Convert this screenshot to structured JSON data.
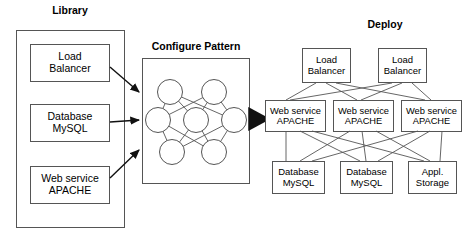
{
  "diagram": {
    "title_library": "Library",
    "title_configure": "Configure Pattern",
    "title_deploy": "Deploy",
    "library_items": [
      {
        "label": "Load\nBalancer"
      },
      {
        "label": "Database\nMySQL"
      },
      {
        "label": "Web service\nAPACHE"
      }
    ],
    "deploy_tier_load_balancers": [
      {
        "label": "Load\nBalancer"
      },
      {
        "label": "Load\nBalancer"
      }
    ],
    "deploy_tier_web_services": [
      {
        "label": "Web service\nAPACHE"
      },
      {
        "label": "Web service\nAPACHE"
      },
      {
        "label": "Web service\nAPACHE"
      }
    ],
    "deploy_tier_storage": [
      {
        "label": "Database\nMySQL"
      },
      {
        "label": "Database\nMySQL"
      },
      {
        "label": "Appl.\nStorage"
      }
    ],
    "pattern_node_count": 7,
    "colors": {
      "stroke": "#444444",
      "box_stroke": "#555555",
      "arrow": "#111111",
      "text": "#000000",
      "background": "#ffffff"
    }
  }
}
